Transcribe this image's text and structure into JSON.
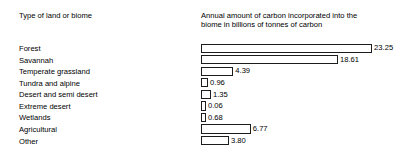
{
  "headers": {
    "left": "Type of land or biome",
    "right": "Annual amount of carbon incorporated into the\nbiome in billions of tonnes of carbon"
  },
  "chart_data": {
    "type": "bar",
    "orientation": "horizontal",
    "title": "",
    "xlabel": "Annual amount of carbon incorporated into the biome in billions of tonnes of carbon",
    "ylabel": "Type of land or biome",
    "grid": false,
    "legend": false,
    "xlim": [
      0,
      23.25
    ],
    "value_labels": true,
    "categories": [
      "Forest",
      "Savannah",
      "Temperate grassland",
      "Tundra and alpine",
      "Desert and semi desert",
      "Extreme desert",
      "Wetlands",
      "Agricultural",
      "Other"
    ],
    "values": [
      23.25,
      18.61,
      4.39,
      0.96,
      1.35,
      0.06,
      0.68,
      6.77,
      3.8
    ],
    "value_text": [
      "23.25",
      "18.61",
      "4.39",
      "0.96",
      "1.35",
      "0.06",
      "0.68",
      "6.77",
      "3.80"
    ]
  },
  "style": {
    "bar_fill": "#ffffff",
    "bar_stroke": "#1c1c1c",
    "text_color": "#000000",
    "background": "#ffffff"
  }
}
